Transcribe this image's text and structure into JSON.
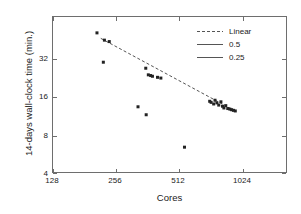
{
  "chart_data": {
    "type": "scatter",
    "title": "",
    "xlabel": "Cores",
    "ylabel": "14-days wall-clock time (min.)",
    "xscale": "log2",
    "yscale": "log2",
    "xlim": [
      128,
      2048
    ],
    "ylim": [
      4,
      45.25
    ],
    "xticks": [
      128,
      256,
      512,
      1024
    ],
    "xtick_labels": [
      "128",
      "256",
      "512",
      "1024"
    ],
    "yticks": [
      4,
      8,
      16,
      32
    ],
    "ytick_labels": [
      "4",
      "8",
      "16",
      "32"
    ],
    "grid": false,
    "legend_position": "upper right",
    "series": [
      {
        "name": "measurements",
        "marker": "square",
        "color": "#222222",
        "points": [
          [
            216,
            35.3
          ],
          [
            236,
            31.5
          ],
          [
            250,
            30.8
          ],
          [
            233,
            22.3
          ],
          [
            386,
            20.3
          ],
          [
            398,
            18.3
          ],
          [
            409,
            18.1
          ],
          [
            418,
            17.9
          ],
          [
            444,
            17.6
          ],
          [
            462,
            17.4
          ],
          [
            352,
            11.1
          ],
          [
            388,
            9.8
          ],
          [
            612,
            5.9
          ],
          [
            826,
            12.1
          ],
          [
            840,
            11.9
          ],
          [
            866,
            11.6
          ],
          [
            880,
            12.3
          ],
          [
            900,
            11.8
          ],
          [
            920,
            11.4
          ],
          [
            944,
            12.0
          ],
          [
            962,
            11.2
          ],
          [
            978,
            10.9
          ],
          [
            1000,
            11.3
          ],
          [
            1024,
            10.8
          ],
          [
            1050,
            10.7
          ],
          [
            1072,
            10.6
          ],
          [
            1096,
            10.5
          ],
          [
            1120,
            10.4
          ]
        ]
      }
    ],
    "trend_line": {
      "name": "Linear",
      "style": "dashed",
      "color": "#555555",
      "x_start": 226,
      "y_start": 32.4,
      "x_end": 1150,
      "y_end": 10.2
    },
    "legend": [
      {
        "label": "Linear",
        "style": "dashed",
        "color": "#555555"
      },
      {
        "label": "0.5",
        "style": "solid",
        "color": "#555555"
      },
      {
        "label": "0.25",
        "style": "solid",
        "color": "#555555"
      }
    ]
  }
}
